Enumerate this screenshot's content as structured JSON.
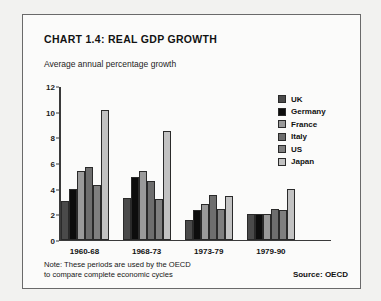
{
  "chart_data": {
    "type": "bar",
    "title": "CHART 1.4: REAL GDP GROWTH",
    "subtitle": "Average annual percentage growth",
    "xlabel": "",
    "ylabel": "",
    "ylim": [
      0,
      12
    ],
    "yticks": [
      0,
      2,
      4,
      6,
      8,
      10,
      12
    ],
    "grid": false,
    "legend_position": "right",
    "categories": [
      "1960-68",
      "1968-73",
      "1973-79",
      "1979-90"
    ],
    "series": [
      {
        "name": "UK",
        "color": "#4a4a4a",
        "values": [
          3.0,
          3.3,
          1.5,
          2.0
        ]
      },
      {
        "name": "Germany",
        "color": "#0d0d0d",
        "values": [
          4.0,
          4.9,
          2.3,
          2.0
        ]
      },
      {
        "name": "France",
        "color": "#9a9a9a",
        "values": [
          5.4,
          5.4,
          2.8,
          2.0
        ]
      },
      {
        "name": "Italy",
        "color": "#6e6e6e",
        "values": [
          5.7,
          4.6,
          3.5,
          2.4
        ]
      },
      {
        "name": "US",
        "color": "#7f7f7f",
        "values": [
          4.3,
          3.2,
          2.4,
          2.3
        ]
      },
      {
        "name": "Japan",
        "color": "#c2c2c2",
        "values": [
          10.2,
          8.5,
          3.4,
          4.0
        ]
      }
    ],
    "notes": [
      "Note: These periods are used by the OECD",
      "to compare complete economic cycles"
    ],
    "source": "Source: OECD"
  }
}
